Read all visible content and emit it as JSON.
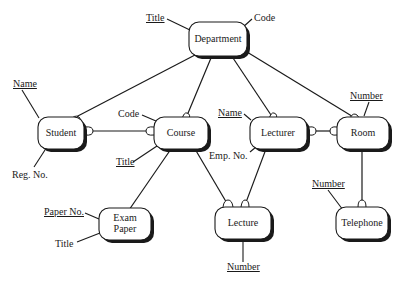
{
  "diagram": {
    "type": "entity-relationship",
    "entities": [
      {
        "id": "department",
        "label": "Department"
      },
      {
        "id": "student",
        "label": "Student"
      },
      {
        "id": "course",
        "label": "Course"
      },
      {
        "id": "lecturer",
        "label": "Lecturer"
      },
      {
        "id": "room",
        "label": "Room"
      },
      {
        "id": "exam_paper",
        "label_line1": "Exam",
        "label_line2": "Paper"
      },
      {
        "id": "lecture",
        "label": "Lecture"
      },
      {
        "id": "telephone",
        "label": "Telephone"
      }
    ],
    "attributes": {
      "department_title": {
        "label": "Title",
        "key": true
      },
      "department_code": {
        "label": "Code",
        "key": false
      },
      "student_name": {
        "label": "Name",
        "key": true
      },
      "student_regno": {
        "label": "Reg. No.",
        "key": false
      },
      "course_code": {
        "label": "Code",
        "key": false
      },
      "course_title": {
        "label": "Title",
        "key": true
      },
      "lecturer_name": {
        "label": "Name",
        "key": true
      },
      "lecturer_empno": {
        "label": "Emp. No.",
        "key": false
      },
      "room_number": {
        "label": "Number",
        "key": true
      },
      "telephone_number": {
        "label": "Number",
        "key": true
      },
      "exam_paperno": {
        "label": "Paper No.",
        "key": true
      },
      "exam_title": {
        "label": "Title",
        "key": false
      },
      "lecture_number": {
        "label": "Number",
        "key": true
      }
    },
    "relationships": [
      {
        "from": "Department",
        "to": "Student",
        "many_end": "Student"
      },
      {
        "from": "Department",
        "to": "Course",
        "many_end": "Course"
      },
      {
        "from": "Department",
        "to": "Lecturer",
        "many_end": "Lecturer"
      },
      {
        "from": "Department",
        "to": "Room",
        "many_end": "Room"
      },
      {
        "from": "Student",
        "to": "Course",
        "many_end": "both"
      },
      {
        "from": "Lecturer",
        "to": "Room",
        "many_end": "both"
      },
      {
        "from": "Course",
        "to": "Exam Paper",
        "many_end": "none"
      },
      {
        "from": "Course",
        "to": "Lecture",
        "many_end": "Lecture"
      },
      {
        "from": "Lecturer",
        "to": "Lecture",
        "many_end": "Lecture"
      },
      {
        "from": "Room",
        "to": "Telephone",
        "many_end": "Telephone"
      }
    ]
  }
}
